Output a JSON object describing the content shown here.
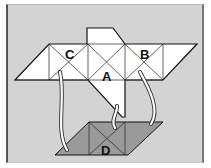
{
  "diagram": {
    "labels": {
      "A": "A",
      "B": "B",
      "C": "C",
      "D": "D"
    },
    "colors": {
      "background": "#d3d3d3",
      "net_fill": "#ffffff",
      "base_fill": "#9a9a9a",
      "line": "#111111",
      "arrow_fill": "#ffffff"
    }
  }
}
